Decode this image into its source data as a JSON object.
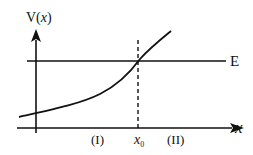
{
  "diagram": {
    "y_axis_label_prefix": "V(",
    "y_axis_label_var": "x",
    "y_axis_label_suffix": ")",
    "x_axis_label": "x",
    "energy_label": "E",
    "region_one_label": "(I)",
    "region_two_label": "(II)",
    "boundary_label_base": "x",
    "boundary_label_sub": "0",
    "colors": {
      "stroke": "#111111",
      "background": "#ffffff"
    }
  }
}
